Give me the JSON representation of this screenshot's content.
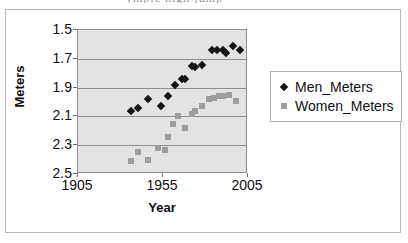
{
  "title_sliver": "ympic high jump",
  "axis": {
    "ylabel": "Meters",
    "xlabel": "Year",
    "yticks": [
      "2.5",
      "2.3",
      "2.1",
      "1.9",
      "1.7",
      "1.5"
    ],
    "xticks": [
      "1905",
      "1955",
      "2005"
    ]
  },
  "legend": {
    "items": [
      {
        "label": "Men_Meters",
        "marker": "diamond-marker",
        "color": "#141414"
      },
      {
        "label": "Women_Meters",
        "marker": "square-marker",
        "color": "#9d9d9d"
      }
    ]
  },
  "colors": {
    "plot_background": "#e3e3e3",
    "gridline": "#8e8e8e",
    "frame_border": "#b9b9b9",
    "men_series": "#141414",
    "women_series": "#9d9d9d"
  },
  "chart_data": {
    "type": "scatter",
    "title": "",
    "xlabel": "Year",
    "ylabel": "Meters",
    "xlim": [
      1905,
      2005
    ],
    "ylim": [
      1.5,
      2.5
    ],
    "xticks": [
      1905,
      1955,
      2005
    ],
    "yticks": [
      1.5,
      1.7,
      1.9,
      2.1,
      2.3,
      2.5
    ],
    "grid": true,
    "legend_position": "right",
    "series": [
      {
        "name": "Men_Meters",
        "marker": "diamond",
        "color": "#141414",
        "points": [
          [
            1936,
            1.94
          ],
          [
            1940,
            1.96
          ],
          [
            1946,
            2.02
          ],
          [
            1954,
            1.97
          ],
          [
            1958,
            2.04
          ],
          [
            1962,
            2.12
          ],
          [
            1966,
            2.16
          ],
          [
            1968,
            2.16
          ],
          [
            1972,
            2.25
          ],
          [
            1974,
            2.24
          ],
          [
            1978,
            2.26
          ],
          [
            1984,
            2.36
          ],
          [
            1987,
            2.36
          ],
          [
            1990,
            2.36
          ],
          [
            1992,
            2.34
          ],
          [
            1996,
            2.39
          ],
          [
            2000,
            2.36
          ]
        ]
      },
      {
        "name": "Women_Meters",
        "marker": "square",
        "color": "#9d9d9d",
        "points": [
          [
            1936,
            1.59
          ],
          [
            1940,
            1.65
          ],
          [
            1946,
            1.6
          ],
          [
            1952,
            1.68
          ],
          [
            1956,
            1.67
          ],
          [
            1958,
            1.76
          ],
          [
            1961,
            1.85
          ],
          [
            1964,
            1.9
          ],
          [
            1968,
            1.82
          ],
          [
            1972,
            1.92
          ],
          [
            1974,
            1.94
          ],
          [
            1978,
            1.97
          ],
          [
            1982,
            2.02
          ],
          [
            1985,
            2.03
          ],
          [
            1988,
            2.04
          ],
          [
            1990,
            2.04
          ],
          [
            1994,
            2.05
          ],
          [
            1998,
            2.01
          ]
        ]
      }
    ]
  }
}
